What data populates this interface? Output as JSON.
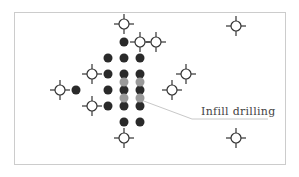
{
  "diagram": {
    "title": "",
    "frame": {
      "x": 14,
      "y": 12,
      "width": 271,
      "height": 152,
      "stroke": "#cccccc"
    },
    "colors": {
      "producer_dot": "#2a2a2a",
      "infill_dot": "#9a9a9a",
      "well_symbol_stroke": "#333333",
      "well_symbol_fill": "#ffffff",
      "leader_line": "#c8c8c8",
      "label_text": "#444444"
    },
    "existing_wells": [
      {
        "x": 124,
        "y": 42
      },
      {
        "x": 108,
        "y": 58
      },
      {
        "x": 124,
        "y": 58
      },
      {
        "x": 140,
        "y": 58
      },
      {
        "x": 108,
        "y": 74
      },
      {
        "x": 124,
        "y": 74
      },
      {
        "x": 140,
        "y": 74
      },
      {
        "x": 76,
        "y": 90
      },
      {
        "x": 108,
        "y": 90
      },
      {
        "x": 124,
        "y": 90
      },
      {
        "x": 140,
        "y": 90
      },
      {
        "x": 108,
        "y": 106
      },
      {
        "x": 124,
        "y": 106
      },
      {
        "x": 140,
        "y": 106
      },
      {
        "x": 124,
        "y": 122
      },
      {
        "x": 140,
        "y": 122
      }
    ],
    "infill_wells": [
      {
        "x": 124,
        "y": 82
      },
      {
        "x": 140,
        "y": 82
      },
      {
        "x": 124,
        "y": 98
      },
      {
        "x": 140,
        "y": 98
      }
    ],
    "injection_wells": [
      {
        "x": 124,
        "y": 24
      },
      {
        "x": 140,
        "y": 42
      },
      {
        "x": 92,
        "y": 74
      },
      {
        "x": 186,
        "y": 74
      },
      {
        "x": 60,
        "y": 90
      },
      {
        "x": 156,
        "y": 42
      },
      {
        "x": 172,
        "y": 90
      },
      {
        "x": 92,
        "y": 106
      },
      {
        "x": 124,
        "y": 138
      },
      {
        "x": 236,
        "y": 26
      },
      {
        "x": 236,
        "y": 138
      }
    ],
    "annotation": {
      "label": "Infill drilling",
      "label_x": 201,
      "label_y": 115,
      "leader_points": "141,100 192,119 268,119"
    }
  }
}
